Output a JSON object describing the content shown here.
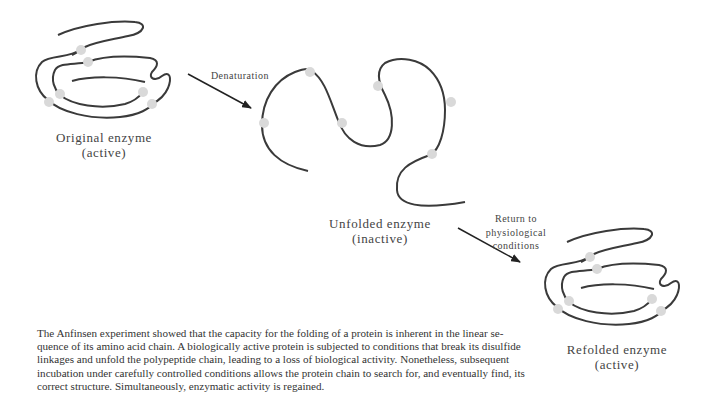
{
  "figure": {
    "original": {
      "title": "Original enzyme",
      "state": "(active)"
    },
    "unfolded": {
      "title": "Unfolded enzyme",
      "state": "(inactive)"
    },
    "refolded": {
      "title": "Refolded enzyme",
      "state": "(active)"
    },
    "arrow_denaturation": {
      "label": "Denaturation"
    },
    "arrow_renaturation": {
      "line1": "Return to",
      "line2": "physiological",
      "line3": "conditions"
    },
    "colors": {
      "chain": "#3a3a3a",
      "disulfide": "#d9d9d9",
      "text": "#444444"
    }
  },
  "caption": {
    "lines": [
      "The Anfinsen experiment showed that the capacity for the folding of a protein is inherent in the linear se-",
      "quence of its amino acid chain. A biologically active protein is subjected to conditions that break its disulfide",
      "linkages and unfold the polypeptide chain, leading to a loss of biological activity. Nonetheless, subsequent",
      "incubation under carefully controlled conditions allows the protein chain to search for, and eventually find, its",
      "correct structure. Simultaneously, enzymatic activity is regained."
    ]
  }
}
